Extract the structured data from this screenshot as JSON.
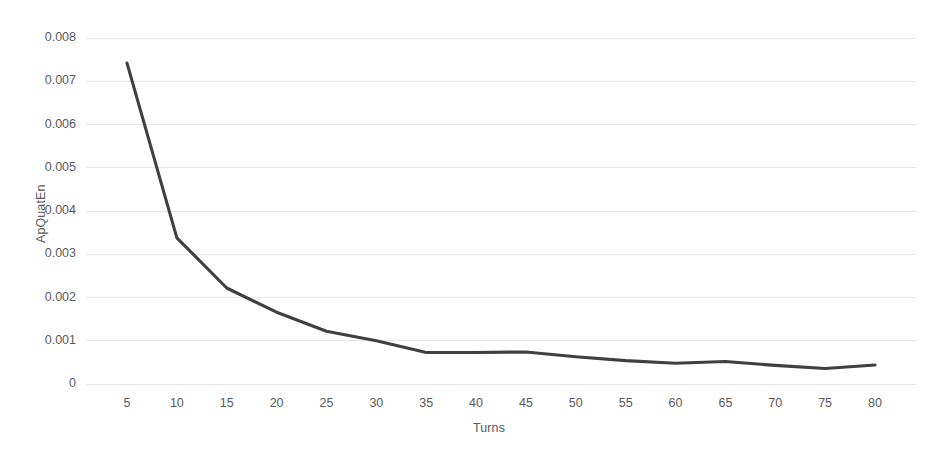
{
  "chart_data": {
    "type": "line",
    "title": "",
    "subtitle": "",
    "xlabel": "Turns",
    "ylabel": "ApQuatEn",
    "x": [
      5,
      10,
      15,
      20,
      25,
      30,
      35,
      40,
      45,
      50,
      55,
      60,
      65,
      70,
      75,
      80
    ],
    "categories": [
      "5",
      "10",
      "15",
      "20",
      "25",
      "30",
      "35",
      "40",
      "45",
      "50",
      "55",
      "60",
      "65",
      "70",
      "75",
      "80"
    ],
    "values": [
      0.00742,
      0.00338,
      0.00222,
      0.00166,
      0.00122,
      0.001,
      0.00073,
      0.00073,
      0.00074,
      0.00063,
      0.00054,
      0.00048,
      0.00052,
      0.00043,
      0.00036,
      0.00044
    ],
    "series": [
      {
        "name": "ApQuatEn",
        "values": [
          0.00742,
          0.00338,
          0.00222,
          0.00166,
          0.00122,
          0.001,
          0.00073,
          0.00073,
          0.00074,
          0.00063,
          0.00054,
          0.00048,
          0.00052,
          0.00043,
          0.00036,
          0.00044
        ]
      }
    ],
    "xlim": [
      5,
      80
    ],
    "ylim": [
      0,
      0.008
    ],
    "ytick_values": [
      0,
      0.001,
      0.002,
      0.003,
      0.004,
      0.005,
      0.006,
      0.007,
      0.008
    ],
    "ytick_labels": [
      "0",
      "0.001",
      "0.002",
      "0.003",
      "0.004",
      "0.005",
      "0.006",
      "0.007",
      "0.008"
    ],
    "grid": true,
    "grid_axis": "y",
    "legend": false,
    "legend_position": "none",
    "marker": "none",
    "annotations": []
  },
  "style": {
    "line_color": "#404040",
    "grid_color": "#e8e8e8",
    "text_color": "#5a5a5a",
    "background": "#ffffff",
    "line_width": 3.1
  },
  "plot_geometry": {
    "left": 86,
    "right": 916,
    "top": 38,
    "bottom": 384,
    "first_point_x": 127,
    "last_point_x": 875
  }
}
